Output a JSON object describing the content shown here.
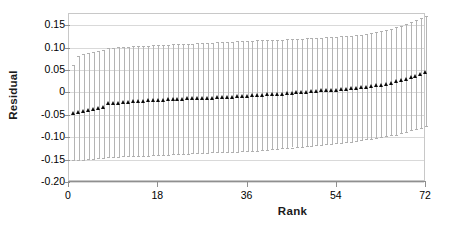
{
  "chart_data": {
    "type": "scatter",
    "title": "",
    "subtitle": "",
    "xlabel": "Rank",
    "ylabel": "Residual",
    "xlim": [
      0,
      72
    ],
    "ylim": [
      -0.2,
      0.175
    ],
    "grid": true,
    "legend": null,
    "marker": "filled-triangle",
    "errorbars": "vertical-with-caps",
    "annotations": [],
    "xtick_labels": [
      "0",
      "18",
      "36",
      "54",
      "72"
    ],
    "xticks": [
      0,
      18,
      36,
      54,
      72
    ],
    "ytick_labels": [
      "0.15",
      "0.10",
      "0.05",
      "0",
      "-0.05",
      "-0.10",
      "-0.15",
      "-0.20"
    ],
    "yticks": [
      0.15,
      0.1,
      0.05,
      0,
      -0.05,
      -0.1,
      -0.15,
      -0.2
    ],
    "x": [
      1,
      2,
      3,
      4,
      5,
      6,
      7,
      8,
      9,
      10,
      11,
      12,
      13,
      14,
      15,
      16,
      17,
      18,
      19,
      20,
      21,
      22,
      23,
      24,
      25,
      26,
      27,
      28,
      29,
      30,
      31,
      32,
      33,
      34,
      35,
      36,
      37,
      38,
      39,
      40,
      41,
      42,
      43,
      44,
      45,
      46,
      47,
      48,
      49,
      50,
      51,
      52,
      53,
      54,
      55,
      56,
      57,
      58,
      59,
      60,
      61,
      62,
      63,
      64,
      65,
      66,
      67,
      68,
      69,
      70,
      71,
      72
    ],
    "values": [
      -0.046,
      -0.044,
      -0.042,
      -0.04,
      -0.038,
      -0.036,
      -0.034,
      -0.025,
      -0.024,
      -0.023,
      -0.022,
      -0.021,
      -0.02,
      -0.019,
      -0.019,
      -0.018,
      -0.018,
      -0.017,
      -0.017,
      -0.016,
      -0.016,
      -0.015,
      -0.015,
      -0.014,
      -0.014,
      -0.013,
      -0.013,
      -0.012,
      -0.012,
      -0.011,
      -0.011,
      -0.01,
      -0.01,
      -0.009,
      -0.009,
      -0.008,
      -0.007,
      -0.007,
      -0.006,
      -0.005,
      -0.004,
      -0.004,
      -0.003,
      -0.002,
      -0.001,
      0.0,
      0.001,
      0.001,
      0.002,
      0.003,
      0.004,
      0.004,
      0.005,
      0.006,
      0.007,
      0.008,
      0.009,
      0.01,
      0.011,
      0.012,
      0.013,
      0.015,
      0.017,
      0.019,
      0.021,
      0.024,
      0.027,
      0.03,
      0.033,
      0.036,
      0.04,
      0.044
    ],
    "error_upper": [
      0.062,
      0.082,
      0.085,
      0.088,
      0.09,
      0.092,
      0.094,
      0.099,
      0.1,
      0.101,
      0.102,
      0.102,
      0.103,
      0.103,
      0.104,
      0.104,
      0.105,
      0.105,
      0.106,
      0.106,
      0.107,
      0.107,
      0.108,
      0.108,
      0.109,
      0.11,
      0.11,
      0.111,
      0.111,
      0.112,
      0.112,
      0.113,
      0.113,
      0.114,
      0.114,
      0.115,
      0.115,
      0.116,
      0.116,
      0.117,
      0.117,
      0.118,
      0.118,
      0.119,
      0.119,
      0.12,
      0.12,
      0.121,
      0.121,
      0.122,
      0.122,
      0.123,
      0.124,
      0.124,
      0.125,
      0.126,
      0.127,
      0.128,
      0.129,
      0.13,
      0.132,
      0.134,
      0.136,
      0.139,
      0.142,
      0.145,
      0.149,
      0.153,
      0.157,
      0.161,
      0.166,
      0.171
    ],
    "error_lower": [
      -0.152,
      -0.151,
      -0.15,
      -0.149,
      -0.148,
      -0.147,
      -0.146,
      -0.145,
      -0.144,
      -0.144,
      -0.143,
      -0.143,
      -0.142,
      -0.142,
      -0.141,
      -0.141,
      -0.14,
      -0.14,
      -0.139,
      -0.139,
      -0.138,
      -0.138,
      -0.137,
      -0.137,
      -0.136,
      -0.136,
      -0.135,
      -0.135,
      -0.134,
      -0.134,
      -0.133,
      -0.133,
      -0.132,
      -0.132,
      -0.131,
      -0.131,
      -0.13,
      -0.13,
      -0.129,
      -0.128,
      -0.127,
      -0.126,
      -0.125,
      -0.124,
      -0.123,
      -0.122,
      -0.121,
      -0.12,
      -0.119,
      -0.118,
      -0.117,
      -0.116,
      -0.115,
      -0.114,
      -0.113,
      -0.111,
      -0.11,
      -0.108,
      -0.107,
      -0.105,
      -0.104,
      -0.102,
      -0.1,
      -0.098,
      -0.096,
      -0.094,
      -0.091,
      -0.088,
      -0.085,
      -0.082,
      -0.079,
      -0.075
    ]
  }
}
